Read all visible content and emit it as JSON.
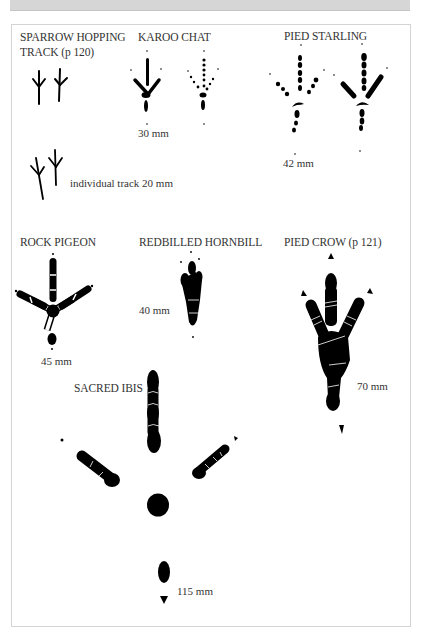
{
  "species": [
    {
      "name": "SPARROW HOPPING",
      "name_line2": "TRACK  (p 120)",
      "measurement": "individual track 20 mm"
    },
    {
      "name": "KAROO CHAT",
      "measurement": "30 mm"
    },
    {
      "name": "PIED STARLING",
      "measurement": "42 mm"
    },
    {
      "name": "ROCK PIGEON",
      "measurement": "45 mm"
    },
    {
      "name": "REDBILLED HORNBILL",
      "measurement": "40 mm"
    },
    {
      "name": "PIED CROW  (p 121)",
      "measurement": "70 mm"
    },
    {
      "name": "SACRED IBIS",
      "measurement": "115 mm"
    }
  ],
  "colors": {
    "ink": "#000000",
    "text": "#333333",
    "frame_border": "#d4d4d4",
    "top_strip": "#d6d6d6"
  }
}
